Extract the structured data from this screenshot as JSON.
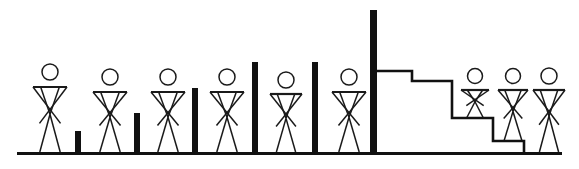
{
  "diagram": {
    "type": "schematic-illustration",
    "background_color": "#ffffff",
    "ink_color": "#111111",
    "figure_color": "#1a1a1a",
    "canvas": {
      "width": 579,
      "height": 169
    },
    "baseline": {
      "name": "ground-line",
      "x_start": 17,
      "x_end": 562,
      "y": 152,
      "thickness": 3
    },
    "bars": [
      {
        "label": "bar-1",
        "x": 75,
        "width": 6,
        "top_y": 131,
        "bottom_y": 152,
        "height": 21
      },
      {
        "label": "bar-2",
        "x": 134,
        "width": 6,
        "top_y": 113,
        "bottom_y": 152,
        "height": 39
      },
      {
        "label": "bar-3",
        "x": 192,
        "width": 6,
        "top_y": 88,
        "bottom_y": 152,
        "height": 64
      },
      {
        "label": "bar-4",
        "x": 252,
        "width": 6,
        "top_y": 62,
        "bottom_y": 152,
        "height": 90
      },
      {
        "label": "bar-5",
        "x": 312,
        "width": 6,
        "top_y": 62,
        "bottom_y": 152,
        "height": 90
      },
      {
        "label": "bar-6",
        "x": 370,
        "width": 7,
        "top_y": 10,
        "bottom_y": 152,
        "height": 142
      }
    ],
    "staircase": {
      "name": "descending-staircase",
      "start_x": 377,
      "start_y": 71,
      "end_x": 524,
      "end_y": 152,
      "steps": [
        {
          "label": "step-1",
          "x_from": 377,
          "x_to": 412,
          "top_y": 71
        },
        {
          "label": "step-2",
          "x_from": 412,
          "x_to": 452,
          "top_y": 81
        },
        {
          "label": "step-3",
          "x_from": 452,
          "x_to": 493,
          "top_y": 118
        },
        {
          "label": "step-4",
          "x_from": 493,
          "x_to": 524,
          "top_y": 141
        }
      ]
    },
    "figures": [
      {
        "label": "figure-1",
        "center_x": 50,
        "head_cy": 72,
        "head_r": 8,
        "shoulder_y": 87,
        "shoulder_half": 17,
        "foot_y": 152,
        "scale": "full"
      },
      {
        "label": "figure-2",
        "center_x": 110,
        "head_cy": 77,
        "head_r": 8,
        "shoulder_y": 92,
        "shoulder_half": 17,
        "foot_y": 152,
        "scale": "full"
      },
      {
        "label": "figure-3",
        "center_x": 168,
        "head_cy": 77,
        "head_r": 8,
        "shoulder_y": 92,
        "shoulder_half": 17,
        "foot_y": 152,
        "scale": "full"
      },
      {
        "label": "figure-4",
        "center_x": 227,
        "head_cy": 77,
        "head_r": 8,
        "shoulder_y": 92,
        "shoulder_half": 17,
        "foot_y": 152,
        "scale": "full"
      },
      {
        "label": "figure-5",
        "center_x": 286,
        "head_cy": 80,
        "head_r": 8,
        "shoulder_y": 94,
        "shoulder_half": 16,
        "foot_y": 152,
        "scale": "full"
      },
      {
        "label": "figure-6",
        "center_x": 349,
        "head_cy": 77,
        "head_r": 8,
        "shoulder_y": 92,
        "shoulder_half": 17,
        "foot_y": 152,
        "scale": "full"
      },
      {
        "label": "figure-7",
        "center_x": 475,
        "head_cy": 76,
        "head_r": 7.5,
        "shoulder_y": 90,
        "shoulder_half": 14,
        "foot_y": 118,
        "scale": "clipped-step-3"
      },
      {
        "label": "figure-8",
        "center_x": 513,
        "head_cy": 76,
        "head_r": 7.5,
        "shoulder_y": 90,
        "shoulder_half": 15,
        "foot_y": 141,
        "scale": "clipped-step-4"
      },
      {
        "label": "figure-9",
        "center_x": 549,
        "head_cy": 76,
        "head_r": 8,
        "shoulder_y": 90,
        "shoulder_half": 16,
        "foot_y": 152,
        "scale": "full"
      }
    ]
  }
}
